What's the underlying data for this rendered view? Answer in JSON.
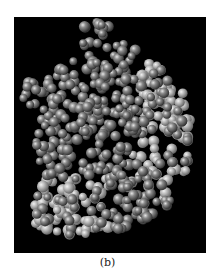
{
  "figure": {
    "caption": "(b)",
    "colors": {
      "background": "#000000",
      "dark_spheres": "#6e6e6e",
      "light_spheres": "#b4b4b4",
      "page": "#ffffff"
    }
  }
}
